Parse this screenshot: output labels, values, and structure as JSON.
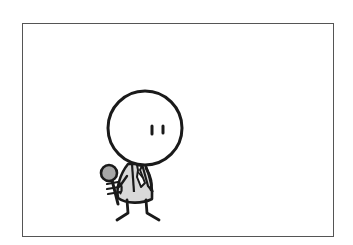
{
  "comic_panel": {
    "description": "Single-panel cartoon: a round-headed stick figure in a suit and tie holding a microphone",
    "colors": {
      "background": "#ffffff",
      "frame": "#555555",
      "ink": "#1a1a1a",
      "shirt_fill": "#d9d9d9",
      "mic_fill": "#a6a6a6"
    },
    "character": {
      "role": "reporter",
      "props": [
        "microphone-icon",
        "necktie-icon"
      ]
    }
  }
}
